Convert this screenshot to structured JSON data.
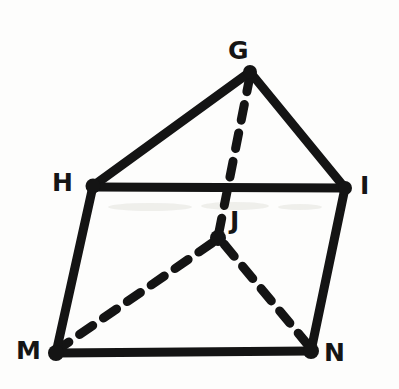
{
  "figure": {
    "background_color": "#fdfdfc",
    "ink_color": "#141414",
    "canvas": {
      "width": 399,
      "height": 389
    }
  },
  "labels": {
    "G": "G",
    "H": "H",
    "I": "I",
    "J": "J",
    "M": "M",
    "N": "N"
  },
  "vertices": [
    {
      "id": "G",
      "label": "G",
      "x": 250,
      "y": 72,
      "label_x": 228,
      "label_y": 38,
      "hidden": false
    },
    {
      "id": "H",
      "label": "H",
      "x": 93,
      "y": 186,
      "label_x": 52,
      "label_y": 170,
      "hidden": false
    },
    {
      "id": "I",
      "label": "I",
      "x": 345,
      "y": 188,
      "label_x": 360,
      "label_y": 173,
      "hidden": false
    },
    {
      "id": "J",
      "label": "J",
      "x": 218,
      "y": 238,
      "label_x": 230,
      "label_y": 208,
      "hidden": true
    },
    {
      "id": "M",
      "label": "M",
      "x": 56,
      "y": 353,
      "label_x": 16,
      "label_y": 338,
      "hidden": false
    },
    {
      "id": "N",
      "label": "N",
      "x": 311,
      "y": 351,
      "label_x": 324,
      "label_y": 340,
      "hidden": false
    }
  ],
  "edges": [
    {
      "id": "GH",
      "from": "G",
      "to": "H",
      "style": "solid",
      "width": 9
    },
    {
      "id": "GI",
      "from": "G",
      "to": "I",
      "style": "solid",
      "width": 9
    },
    {
      "id": "HI",
      "from": "H",
      "to": "I",
      "style": "solid",
      "width": 9
    },
    {
      "id": "HM",
      "from": "H",
      "to": "M",
      "style": "solid",
      "width": 9
    },
    {
      "id": "IN",
      "from": "I",
      "to": "N",
      "style": "solid",
      "width": 9
    },
    {
      "id": "MN",
      "from": "M",
      "to": "N",
      "style": "solid",
      "width": 9
    },
    {
      "id": "GJ",
      "from": "G",
      "to": "J",
      "style": "dashed",
      "width": 9,
      "dash": "16 13"
    },
    {
      "id": "JM",
      "from": "J",
      "to": "M",
      "style": "dashed",
      "width": 9,
      "dash": "16 13"
    },
    {
      "id": "JN",
      "from": "J",
      "to": "N",
      "style": "dashed",
      "width": 9,
      "dash": "16 13"
    }
  ]
}
